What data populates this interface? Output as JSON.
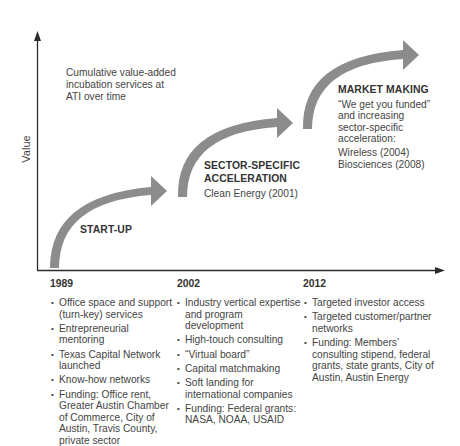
{
  "diagram": {
    "type": "timeline-growth",
    "y_axis_label": "Value",
    "note": {
      "line1": "Cumulative value-added",
      "line2": "incubation services at",
      "line3": "ATI over time"
    },
    "phases": [
      {
        "title": "START-UP",
        "year": "1989"
      },
      {
        "title_line1": "SECTOR-SPECIFIC",
        "title_line2": "ACCELERATION",
        "sub": "Clean Energy (2001)",
        "year": "2002"
      },
      {
        "title": "MARKET MAKING",
        "sub_line1": "“We get you funded”",
        "sub_line2": "and increasing",
        "sub_line3": "sector-specific",
        "sub_line4": "acceleration:",
        "list_line1": "Wireless (2004)",
        "list_line2": "Biosciences (2008)",
        "year": "2012"
      }
    ],
    "columns": [
      {
        "year": "1989",
        "items": [
          "Office space and support (turn-key) services",
          "Entrepreneurial mentoring",
          "Texas Capital Network launched",
          "Know-how networks",
          "Funding: Office rent, Greater Austin Chamber of Commerce, City of Austin, Travis County, private sector"
        ]
      },
      {
        "year": "2002",
        "items": [
          "Industry vertical expertise and program development",
          "High-touch consulting",
          "“Virtual board”",
          "Capital matchmaking",
          "Soft landing for international companies",
          "Funding: Federal grants: NASA, NOAA, USAID"
        ]
      },
      {
        "year": "2012",
        "items": [
          "Targeted investor access",
          "Targeted customer/partner networks",
          "Funding: Members’ consulting stipend, federal grants, state grants, City of Austin, Austin Energy"
        ]
      }
    ],
    "colors": {
      "arrow_fill": "#8c8c8c",
      "axis": "#2b2b2b",
      "text": "#444444"
    }
  }
}
